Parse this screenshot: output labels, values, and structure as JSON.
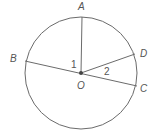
{
  "diagram": {
    "type": "circle-with-radii",
    "center": {
      "label": "O",
      "x": 81,
      "y": 73
    },
    "radius": 56,
    "points": [
      {
        "label": "A",
        "x": 82,
        "y": 17
      },
      {
        "label": "B",
        "x": 25,
        "y": 61
      },
      {
        "label": "C",
        "x": 137,
        "y": 86
      },
      {
        "label": "D",
        "x": 135,
        "y": 54
      }
    ],
    "segments": [
      "OA",
      "BC",
      "OD"
    ],
    "angles": [
      {
        "label": "1",
        "between": "AOB"
      },
      {
        "label": "2",
        "between": "DOC"
      }
    ],
    "colors": {
      "stroke": "#6b6b6b",
      "text": "#555555",
      "dot": "#444444"
    }
  }
}
